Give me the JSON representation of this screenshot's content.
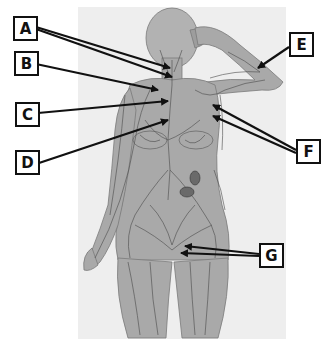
{
  "figure": {
    "background_panel_color": "#eeeeee",
    "body_color": "#a9a9a9",
    "vessel_color": "#4a4a4a",
    "arrow_color": "#111111"
  },
  "labels": [
    {
      "id": "A",
      "text": "A",
      "box": {
        "x": 13,
        "y": 16
      },
      "targets": [
        [
          170,
          68
        ],
        [
          172,
          77
        ]
      ]
    },
    {
      "id": "B",
      "text": "B",
      "box": {
        "x": 14,
        "y": 51
      },
      "targets": [
        [
          158,
          90
        ]
      ]
    },
    {
      "id": "C",
      "text": "C",
      "box": {
        "x": 15,
        "y": 102
      },
      "targets": [
        [
          168,
          101
        ]
      ]
    },
    {
      "id": "D",
      "text": "D",
      "box": {
        "x": 15,
        "y": 150
      },
      "targets": [
        [
          168,
          120
        ]
      ]
    },
    {
      "id": "E",
      "text": "E",
      "box": {
        "x": 289,
        "y": 32
      },
      "targets": [
        [
          258,
          68
        ]
      ]
    },
    {
      "id": "F",
      "text": "F",
      "box": {
        "x": 296,
        "y": 139
      },
      "targets": [
        [
          213,
          105
        ],
        [
          213,
          116
        ]
      ]
    },
    {
      "id": "G",
      "text": "G",
      "box": {
        "x": 259,
        "y": 243
      },
      "targets": [
        [
          185,
          246
        ],
        [
          181,
          253
        ]
      ]
    }
  ]
}
